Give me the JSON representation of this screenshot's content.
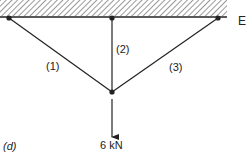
{
  "diagram": {
    "support_label": "E",
    "members": [
      {
        "id": "1",
        "label": "(1)"
      },
      {
        "id": "2",
        "label": "(2)"
      },
      {
        "id": "3",
        "label": "(3)"
      }
    ],
    "load": {
      "label": "6 kN",
      "direction": "down"
    },
    "figure_label": "(d)",
    "colors": {
      "line": "#222222",
      "hatch": "#555555",
      "background": "#ffffff"
    }
  }
}
